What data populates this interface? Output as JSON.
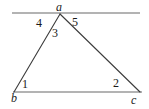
{
  "figure": {
    "type": "geometry-diagram",
    "background_color": "#ffffff",
    "canvas": {
      "width": 149,
      "height": 109
    }
  },
  "colors": {
    "construction_line": "#9a9a9a",
    "triangle_side": "#3c3c3c",
    "label_text": "#1a1a1a"
  },
  "points": {
    "a": {
      "label": "a",
      "x": 60,
      "y": 14
    },
    "b": {
      "label": "b",
      "x": 14,
      "y": 92
    },
    "c": {
      "label": "c",
      "x": 140,
      "y": 92
    }
  },
  "segments": [
    {
      "name": "line-through-a",
      "x1": 12,
      "y1": 13,
      "x2": 140,
      "y2": 13,
      "color": "#9a9a9a",
      "width": 1.6
    },
    {
      "name": "side-bc",
      "x1": 13,
      "y1": 92,
      "x2": 142,
      "y2": 92,
      "color": "#9a9a9a",
      "width": 1.6
    },
    {
      "name": "side-ab",
      "x1": 60,
      "y1": 14,
      "x2": 14,
      "y2": 92,
      "color": "#3c3c3c",
      "width": 1.1
    },
    {
      "name": "side-ac",
      "x1": 60,
      "y1": 14,
      "x2": 140,
      "y2": 92,
      "color": "#3c3c3c",
      "width": 1.1
    }
  ],
  "vertex_labels": [
    {
      "id": "a",
      "text": "a"
    },
    {
      "id": "b",
      "text": "b"
    },
    {
      "id": "c",
      "text": "c"
    }
  ],
  "angle_labels": [
    {
      "id": "1",
      "text": "1",
      "at_vertex": "b",
      "description": "interior angle at b"
    },
    {
      "id": "2",
      "text": "2",
      "at_vertex": "c",
      "description": "interior angle at c"
    },
    {
      "id": "3",
      "text": "3",
      "at_vertex": "a",
      "description": "interior angle at a"
    },
    {
      "id": "4",
      "text": "4",
      "at_vertex": "a",
      "description": "angle left of a between line and side ab"
    },
    {
      "id": "5",
      "text": "5",
      "at_vertex": "a",
      "description": "angle right of a between line and side ac"
    }
  ]
}
